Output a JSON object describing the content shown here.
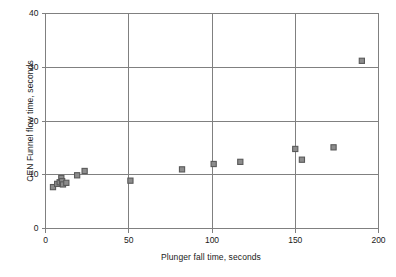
{
  "chart_data": {
    "type": "scatter",
    "title": "",
    "xlabel": "Plunger fall time, seconds",
    "ylabel": "CEN Funnel flow time, seconds",
    "xlim": [
      0,
      200
    ],
    "ylim": [
      0,
      40
    ],
    "xticks": [
      0,
      50,
      100,
      150,
      200
    ],
    "yticks": [
      0,
      10,
      20,
      30,
      40
    ],
    "xtick_labels": [
      "0",
      "50",
      "100",
      "150",
      "200"
    ],
    "ytick_labels": [
      "0",
      "10",
      "20",
      "30",
      "40"
    ],
    "grid": true,
    "grid_axes": "both",
    "legend": false,
    "marker": "square",
    "marker_fill": "#8c8c8c",
    "marker_edge": "#595959",
    "axis_color": "#808080",
    "grid_color": "#808080",
    "text_color": "#1a1a1a",
    "background": "#ffffff",
    "series": [
      {
        "name": "Mix data",
        "points": [
          [
            4.5,
            7.7
          ],
          [
            7.0,
            8.3
          ],
          [
            8.5,
            8.6
          ],
          [
            9.5,
            9.4
          ],
          [
            10.0,
            8.8
          ],
          [
            10.5,
            8.2
          ],
          [
            12.5,
            8.5
          ],
          [
            19.0,
            9.9
          ],
          [
            23.5,
            10.7
          ],
          [
            51.0,
            8.9
          ],
          [
            82.0,
            11.0
          ],
          [
            101.0,
            12.0
          ],
          [
            117.0,
            12.4
          ],
          [
            150.0,
            14.8
          ],
          [
            154.0,
            12.8
          ],
          [
            173.0,
            15.1
          ],
          [
            190.0,
            31.2
          ]
        ]
      }
    ]
  }
}
